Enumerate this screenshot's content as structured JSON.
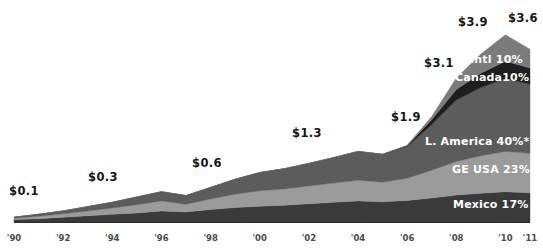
{
  "chart_data": {
    "type": "area",
    "title": "",
    "subtitle": "",
    "xlabel": "",
    "ylabel": "",
    "stacked": true,
    "grid": false,
    "legend_position": "inline-right",
    "xlim": [
      1990,
      2011
    ],
    "ylim": [
      0,
      4.0
    ],
    "x": [
      1990,
      1991,
      1992,
      1993,
      1994,
      1995,
      1996,
      1997,
      1998,
      1999,
      2000,
      2001,
      2002,
      2003,
      2004,
      2005,
      2006,
      2007,
      2008,
      2009,
      2010,
      2011
    ],
    "tick_labels": [
      "'90",
      "'92",
      "'94",
      "'96",
      "'98",
      "'00",
      "'02",
      "'04",
      "'06",
      "'08",
      "'10",
      "'11"
    ],
    "tick_values": [
      1990,
      1992,
      1994,
      1996,
      1998,
      2000,
      2002,
      2004,
      2006,
      2008,
      2010,
      2011
    ],
    "series": [
      {
        "name": "Mexico",
        "label": "Mexico 17%",
        "share": "17%",
        "color": "#3a3a3a",
        "values": [
          0.05,
          0.07,
          0.1,
          0.13,
          0.16,
          0.19,
          0.23,
          0.21,
          0.26,
          0.3,
          0.33,
          0.35,
          0.38,
          0.41,
          0.44,
          0.42,
          0.45,
          0.5,
          0.56,
          0.6,
          0.63,
          0.61
        ]
      },
      {
        "name": "GE USA",
        "label": "GE USA 23%",
        "share": "23%",
        "color": "#9b9b9b",
        "values": [
          0.03,
          0.05,
          0.07,
          0.1,
          0.13,
          0.17,
          0.21,
          0.16,
          0.22,
          0.28,
          0.32,
          0.34,
          0.37,
          0.4,
          0.43,
          0.41,
          0.46,
          0.58,
          0.7,
          0.78,
          0.84,
          0.82
        ]
      },
      {
        "name": "L. America",
        "label": "L. America 40%*",
        "share": "40%*",
        "color": "#5c5c5c",
        "values": [
          0.02,
          0.04,
          0.06,
          0.09,
          0.12,
          0.16,
          0.19,
          0.18,
          0.24,
          0.31,
          0.38,
          0.42,
          0.47,
          0.53,
          0.6,
          0.58,
          0.66,
          0.95,
          1.28,
          1.42,
          1.52,
          1.44
        ]
      },
      {
        "name": "Canada",
        "label": "Canada10%",
        "share": "10%",
        "color": "#1e1e1e",
        "values": [
          0.0,
          0.0,
          0.0,
          0.0,
          0.0,
          0.0,
          0.0,
          0.0,
          0.0,
          0.0,
          0.0,
          0.0,
          0.0,
          0.0,
          0.0,
          0.0,
          0.02,
          0.1,
          0.22,
          0.3,
          0.36,
          0.34
        ]
      },
      {
        "name": "Intl",
        "label": "Intl 10%",
        "share": "10%",
        "color": "#7b7b7b",
        "values": [
          0.0,
          0.0,
          0.0,
          0.0,
          0.0,
          0.0,
          0.0,
          0.0,
          0.0,
          0.0,
          0.0,
          0.0,
          0.0,
          0.0,
          0.0,
          0.0,
          0.01,
          0.07,
          0.24,
          0.4,
          0.55,
          0.39
        ]
      }
    ],
    "totals": [
      0.1,
      0.16,
      0.23,
      0.32,
      0.41,
      0.52,
      0.63,
      0.55,
      0.72,
      0.89,
      1.03,
      1.11,
      1.22,
      1.34,
      1.47,
      1.41,
      1.6,
      2.2,
      3.0,
      3.5,
      3.9,
      3.6
    ],
    "annotations": [
      {
        "text": "$0.1",
        "x_px": 9,
        "y_px": 185
      },
      {
        "text": "$0.3",
        "x_px": 88,
        "y_px": 171
      },
      {
        "text": "$0.6",
        "x_px": 192,
        "y_px": 157
      },
      {
        "text": "$1.3",
        "x_px": 292,
        "y_px": 127
      },
      {
        "text": "$1.9",
        "x_px": 391,
        "y_px": 111
      },
      {
        "text": "$3.1",
        "x_px": 424,
        "y_px": 57
      },
      {
        "text": "$3.9",
        "x_px": 458,
        "y_px": 16
      },
      {
        "text": "$3.6",
        "x_px": 508,
        "y_px": 12
      }
    ],
    "inline_labels": [
      {
        "text": "Intl 10%",
        "x_px": 470,
        "y_px": 54
      },
      {
        "text": "Canada10%",
        "x_px": 455,
        "y_px": 72
      },
      {
        "text": "L. America 40%*",
        "x_px": 425,
        "y_px": 136
      },
      {
        "text": "GE USA 23%",
        "x_px": 452,
        "y_px": 164
      },
      {
        "text": "Mexico 17%",
        "x_px": 453,
        "y_px": 199
      }
    ],
    "footnote": "*"
  }
}
